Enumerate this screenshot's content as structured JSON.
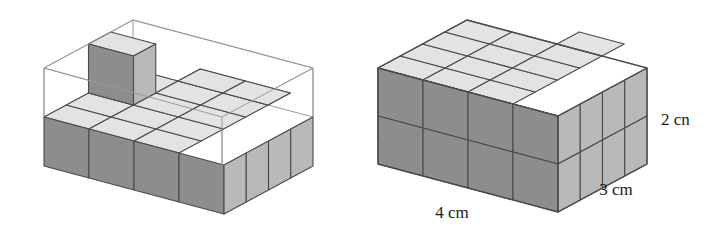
{
  "figure": {
    "background_color": "#ffffff",
    "palette": {
      "top_face": "#e3e3e3",
      "front_face": "#8d8d8d",
      "side_face": "#b9b9b9",
      "outline": "#4a4a4a",
      "wireframe": "#9a9a9a",
      "label_color": "#1a1a1a"
    },
    "left_diagram": {
      "name": "partially-filled-box",
      "description": "Open wireframe box 4 by 3 by 2 containing one full bottom layer of 12 unit cubes plus one extra cube on top",
      "dimensions": {
        "length": 4,
        "width": 3,
        "height": 2
      },
      "filled_cubes": 13,
      "bottom_layer_cubes": 12,
      "top_layer_cubes": 1,
      "labels": []
    },
    "right_diagram": {
      "name": "complete-solid-box",
      "description": "Completely filled rectangular prism built from 24 unit cubes, 4 by 3 by 2",
      "dimensions": {
        "length": 4,
        "width": 3,
        "height": 2
      },
      "total_cubes": 24,
      "labels": [
        {
          "id": "length-label",
          "text": "4 cm",
          "position": "bottom-front-left",
          "x": 452,
          "y": 218
        },
        {
          "id": "width-label",
          "text": "3 cm",
          "position": "bottom-front-right",
          "x": 616,
          "y": 195
        },
        {
          "id": "height-label",
          "text": "2 cn",
          "position": "right-side",
          "x": 661,
          "y": 125
        }
      ]
    }
  }
}
